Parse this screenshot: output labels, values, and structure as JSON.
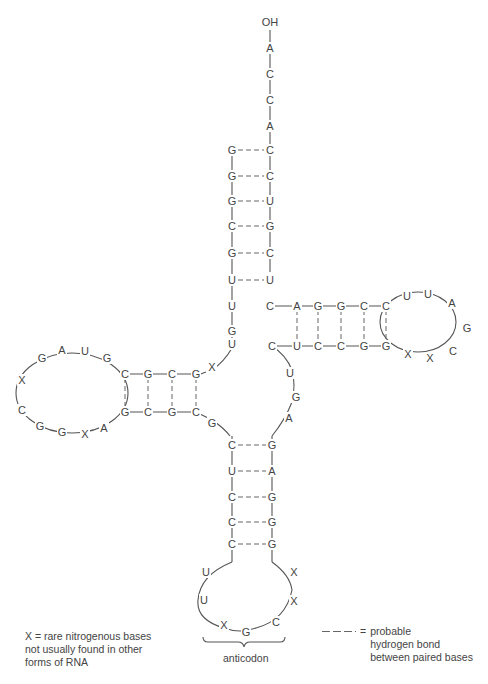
{
  "acceptor_end": {
    "terminus": "OH",
    "tail": [
      "A",
      "C",
      "C",
      "A"
    ]
  },
  "acceptor_stem": {
    "left": [
      "G",
      "G",
      "G",
      "C",
      "G",
      "U",
      "U"
    ],
    "right": [
      "C",
      "C",
      "U",
      "G",
      "C",
      "U",
      "U"
    ]
  },
  "junction_left": [
    "G",
    "U"
  ],
  "d_arm": {
    "stem_top": [
      "C",
      "G",
      "C",
      "G"
    ],
    "stem_bottom": [
      "G",
      "C",
      "G",
      "C"
    ],
    "loop": [
      "G",
      "A",
      "U",
      "G",
      "X",
      "C",
      "G",
      "G",
      "X",
      "A"
    ],
    "connector": "X"
  },
  "variable_region": [
    "G"
  ],
  "anticodon_arm": {
    "stem_left": [
      "C",
      "U",
      "C",
      "C",
      "C"
    ],
    "stem_right": [
      "G",
      "A",
      "G",
      "G",
      "G"
    ],
    "loop": [
      "U",
      "U",
      "X",
      "G",
      "C",
      "X",
      "X"
    ],
    "anticodon_label": "anticodon"
  },
  "extra_loop": [
    "A",
    "G",
    "U",
    "C"
  ],
  "t_arm": {
    "stem_top": [
      "C",
      "A",
      "G",
      "G",
      "C",
      "C"
    ],
    "stem_bottom": [
      "U",
      "C",
      "C",
      "G",
      "G"
    ],
    "loop": [
      "U",
      "U",
      "A",
      "G",
      "C",
      "X",
      "X"
    ]
  },
  "legend": {
    "x_definition_line1": "X  =  rare nitrogenous bases",
    "x_definition_line2": "not usually found in other",
    "x_definition_line3": "forms of RNA",
    "hbond_equals": "=",
    "hbond_line1": "probable",
    "hbond_line2": "hydrogen bond",
    "hbond_line3": "between paired bases"
  }
}
